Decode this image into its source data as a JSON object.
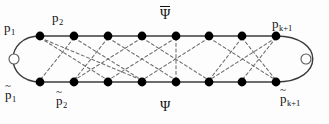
{
  "figure": {
    "kind": "graph-diagram",
    "width": 329,
    "height": 124,
    "background_color": "#fdfdfd",
    "node_color": "#000000",
    "solid_edge_color": "#3c3c3c",
    "dashed_edge_color": "#6b6b6b",
    "endpoint_circle_color": "#555555"
  },
  "labels": {
    "p1": {
      "base": "p",
      "sub": "1"
    },
    "p2": {
      "base": "p",
      "sub": "2"
    },
    "pk1": {
      "base": "p",
      "sub": "k+1"
    },
    "p1_tilde": {
      "base": "p",
      "sub": "1",
      "accent": "~"
    },
    "p2_tilde": {
      "base": "p",
      "sub": "2",
      "accent": "~"
    },
    "pk1_tilde": {
      "base": "p",
      "sub": "k+1",
      "accent": "~"
    },
    "psi_top": {
      "text": "Ψ",
      "accent": "overline"
    },
    "psi_bottom": {
      "text": "Ψ",
      "accent": "none"
    }
  },
  "graph_data": {
    "top_row_label": "Ψ̅",
    "bottom_row_label": "Ψ",
    "node_count_per_row": 8,
    "node_radius": 4.4,
    "top_row_y": 36,
    "bottom_row_y": 82,
    "node_x": [
      40,
      74,
      108,
      142,
      176,
      209,
      242,
      276
    ],
    "endpoint_circles": [
      {
        "cx": 14,
        "cy": 59,
        "r": 5.0
      },
      {
        "cx": 306,
        "cy": 59,
        "r": 5.0
      }
    ],
    "solid_top_edges": [
      [
        0,
        1
      ],
      [
        1,
        2
      ],
      [
        2,
        3
      ],
      [
        3,
        4
      ],
      [
        4,
        5
      ],
      [
        5,
        6
      ],
      [
        6,
        7
      ]
    ],
    "solid_bottom_edges": [
      [
        0,
        1
      ],
      [
        1,
        2
      ],
      [
        2,
        3
      ],
      [
        3,
        4
      ],
      [
        4,
        5
      ],
      [
        5,
        6
      ],
      [
        6,
        7
      ]
    ],
    "left_arc": {
      "from_top": 0,
      "to_bottom": 0,
      "bulge_x": 4
    },
    "right_arc": {
      "from_top": 7,
      "to_bottom": 7,
      "bulge_x": 325
    },
    "dashed_cross_edges": [
      [
        0,
        2
      ],
      [
        0,
        3
      ],
      [
        1,
        0
      ],
      [
        1,
        3
      ],
      [
        2,
        1
      ],
      [
        2,
        4
      ],
      [
        3,
        1
      ],
      [
        3,
        5
      ],
      [
        4,
        2
      ],
      [
        4,
        4
      ],
      [
        5,
        3
      ],
      [
        5,
        7
      ],
      [
        6,
        5
      ],
      [
        6,
        7
      ],
      [
        7,
        5
      ],
      [
        7,
        6
      ]
    ]
  }
}
